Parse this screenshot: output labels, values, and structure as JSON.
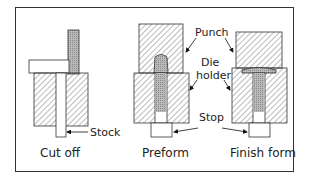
{
  "diagram": {
    "panels": [
      {
        "caption": "Cut off"
      },
      {
        "caption": "Preform"
      },
      {
        "caption": "Finish form"
      }
    ],
    "labels": {
      "stock": "Stock",
      "punch": "Punch",
      "die_holder_line1": "Die",
      "die_holder_line2": "holder",
      "stop": "Stop"
    }
  }
}
